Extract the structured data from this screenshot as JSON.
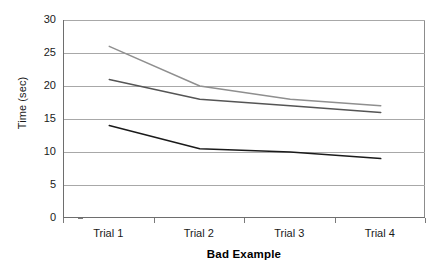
{
  "chart_data": {
    "type": "line",
    "title": "",
    "xlabel": "Bad Example",
    "ylabel": "Time (sec)",
    "categories": [
      "Trial 1",
      "Trial 2",
      "Trial 3",
      "Trial 4"
    ],
    "ylim": [
      0,
      30
    ],
    "yticks": [
      0,
      5,
      10,
      15,
      20,
      25,
      30
    ],
    "ytick_labels": [
      "0",
      "5",
      "10",
      "15",
      "20",
      "25",
      "30"
    ],
    "grid": "horizontal",
    "legend": "none",
    "series": [
      {
        "name": "series-1",
        "color": "#8f8f8f",
        "values": [
          26,
          20,
          18,
          17
        ]
      },
      {
        "name": "series-2",
        "color": "#555555",
        "values": [
          21,
          18,
          17,
          16
        ]
      },
      {
        "name": "series-3",
        "color": "#1a1a1a",
        "values": [
          14,
          10.5,
          10,
          9
        ]
      }
    ]
  },
  "axes": {
    "y_title": "Time (sec)",
    "x_title": "Bad Example"
  }
}
